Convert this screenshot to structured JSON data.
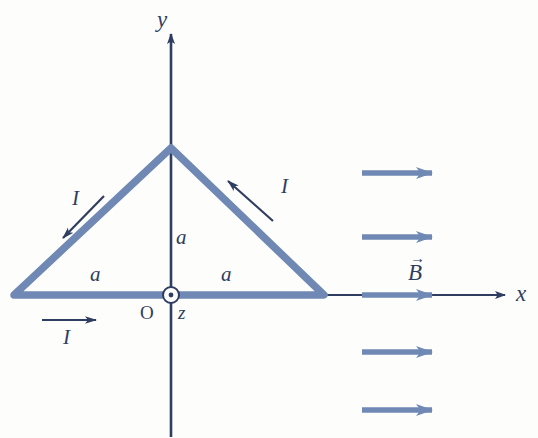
{
  "figure": {
    "colors": {
      "axis": "#2f3d60",
      "loop": "#7089b4",
      "field_arrow": "#7089b4",
      "label": "#2f3d60",
      "background": "#fdfdfc"
    },
    "axes": {
      "y_label": "y",
      "x_label": "x",
      "z_label": "z",
      "origin_label": "O",
      "origin_marker": "dot-in-circle-icon"
    },
    "loop": {
      "shape": "triangle",
      "side_length_label": "a",
      "current_label": "I",
      "side_labels": [
        {
          "name": "left-side-length",
          "text": "a"
        },
        {
          "name": "bottom-left-half-length",
          "text": "a"
        },
        {
          "name": "bottom-right-half-length",
          "text": "a"
        },
        {
          "name": "height-label",
          "text": "a"
        }
      ],
      "current_labels": [
        {
          "name": "current-left-side",
          "text": "I"
        },
        {
          "name": "current-right-side",
          "text": "I"
        },
        {
          "name": "current-bottom-side",
          "text": "I"
        }
      ]
    },
    "field": {
      "label": "B",
      "vector_accent": "→",
      "direction": "+x",
      "arrow_count": 4
    }
  }
}
